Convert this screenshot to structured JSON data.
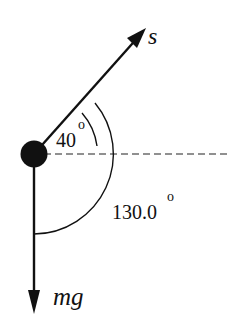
{
  "diagram": {
    "type": "free-body force diagram",
    "vectors": [
      {
        "id": "s",
        "label": "s",
        "direction_deg_from_horizontal": 40
      },
      {
        "id": "mg",
        "label": "mg",
        "direction": "down"
      }
    ],
    "reference_line": "horizontal dashed",
    "angles": [
      {
        "label": "40",
        "unit": "o",
        "between": [
          "horizontal",
          "s"
        ]
      },
      {
        "label": "130.0",
        "unit": "o",
        "between": [
          "s",
          "mg"
        ]
      }
    ],
    "colors": {
      "ink": "#111111",
      "background": "#ffffff"
    }
  }
}
